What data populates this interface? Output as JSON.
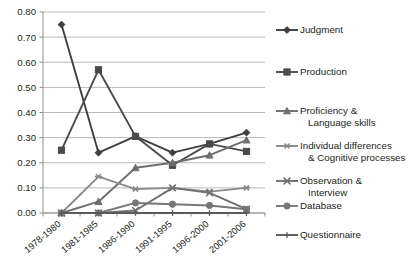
{
  "chart_data": {
    "type": "line",
    "title": "",
    "xlabel": "",
    "ylabel": "",
    "categories": [
      "1978-1980",
      "1981-1985",
      "1986-1990",
      "1991-1995",
      "1996-2000",
      "2001-2006"
    ],
    "ylim": [
      0.0,
      0.8
    ],
    "ytick_labels": [
      "0.00",
      "0.10",
      "0.20",
      "0.30",
      "0.40",
      "0.50",
      "0.60",
      "0.70",
      "0.80"
    ],
    "ytick_values": [
      0.0,
      0.1,
      0.2,
      0.3,
      0.4,
      0.5,
      0.6,
      0.7,
      0.8
    ],
    "grid": true,
    "legend_position": "right",
    "series": [
      {
        "name": "Judgment",
        "marker": "diamond",
        "color": "#3f3f3f",
        "values": [
          0.75,
          0.24,
          0.305,
          0.24,
          0.275,
          0.32
        ]
      },
      {
        "name": "Production",
        "marker": "square",
        "color": "#4a4a4a",
        "values": [
          0.25,
          0.57,
          0.305,
          0.19,
          0.275,
          0.245
        ]
      },
      {
        "name": "Proficiency & Language skills",
        "label_line1": "Proficiency &",
        "label_line2": "Language skills",
        "marker": "triangle",
        "color": "#6e6e6e",
        "values": [
          0.0,
          0.045,
          0.18,
          0.2,
          0.23,
          0.29
        ]
      },
      {
        "name": "Individual differences & Cognitive processes",
        "label_line1": "Individual differences",
        "label_line2": "& Cognitive processes",
        "marker": "asterisk",
        "color": "#8a8a8a",
        "values": [
          0.0,
          0.145,
          0.095,
          0.1,
          0.085,
          0.1
        ]
      },
      {
        "name": "Observation & Interview",
        "label_line1": "Observation &",
        "label_line2": "Interview",
        "marker": "cross",
        "color": "#707070",
        "values": [
          0.0,
          0.0,
          0.01,
          0.1,
          0.08,
          0.015
        ]
      },
      {
        "name": "Database",
        "marker": "circle",
        "color": "#767676",
        "values": [
          0.0,
          0.0,
          0.04,
          0.035,
          0.03,
          0.015
        ]
      },
      {
        "name": "Questionnaire",
        "marker": "plus",
        "color": "#5a5a5a",
        "values": [
          0.0,
          0.0,
          0.0,
          0.0,
          0.0,
          0.0
        ]
      }
    ]
  },
  "legend": {
    "entries": [
      {
        "label": "Judgment"
      },
      {
        "label": "Production"
      },
      {
        "label": "Proficiency &",
        "label2": "Language skills"
      },
      {
        "label": "Individual differences",
        "label2": "& Cognitive processes"
      },
      {
        "label": "Observation &",
        "label2": "Interview"
      },
      {
        "label": "Database"
      },
      {
        "label": "Questionnaire"
      }
    ]
  }
}
